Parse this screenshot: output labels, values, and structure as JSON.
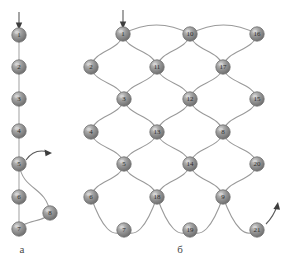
{
  "figure": {
    "panels": [
      {
        "id": "a",
        "caption": "а",
        "type": "linear-chain",
        "node_count": 8
      },
      {
        "id": "b",
        "caption": "б",
        "type": "lattice-network",
        "node_count": 21
      }
    ],
    "colors": {
      "node_fill": "#8c8c8c",
      "node_highlight": "#c9c9c9",
      "node_shadow": "#5f5f5f",
      "node_stroke": "#6e6e6e",
      "edge": "#9a9a9a",
      "arrow": "#3d3d3d",
      "label_text": "#2b2b2b",
      "background": "#ffffff"
    }
  },
  "panel_a": {
    "caption": "а",
    "entry_arrow": {
      "label": "input-arrow",
      "direction": "down"
    },
    "exit_arrow": {
      "label": "output-arrow",
      "direction": "right",
      "from_node": "5"
    },
    "nodes": [
      {
        "id": "1",
        "label": "1",
        "cx": 19,
        "cy": 35
      },
      {
        "id": "2",
        "label": "2",
        "cx": 19,
        "cy": 67
      },
      {
        "id": "3",
        "label": "3",
        "cx": 19,
        "cy": 99
      },
      {
        "id": "4",
        "label": "4",
        "cx": 19,
        "cy": 131
      },
      {
        "id": "5",
        "label": "5",
        "cx": 19,
        "cy": 164
      },
      {
        "id": "6",
        "label": "6",
        "cx": 19,
        "cy": 197
      },
      {
        "id": "7",
        "label": "7",
        "cx": 19,
        "cy": 229
      },
      {
        "id": "8",
        "label": "8",
        "cx": 50,
        "cy": 213
      }
    ],
    "edges": [
      {
        "from": "1",
        "to": "2",
        "shape": "straight"
      },
      {
        "from": "2",
        "to": "3",
        "shape": "straight"
      },
      {
        "from": "3",
        "to": "4",
        "shape": "straight"
      },
      {
        "from": "4",
        "to": "5",
        "shape": "straight"
      },
      {
        "from": "5",
        "to": "6",
        "shape": "straight"
      },
      {
        "from": "6",
        "to": "7",
        "shape": "straight"
      },
      {
        "from": "5",
        "to": "8",
        "shape": "curve"
      },
      {
        "from": "8",
        "to": "7",
        "shape": "curve"
      }
    ]
  },
  "panel_b": {
    "caption": "б",
    "entry_arrow": {
      "label": "input-arrow",
      "direction": "down",
      "to_node": "1"
    },
    "exit_arrow": {
      "label": "output-arrow",
      "direction": "up-right",
      "from_node": "21"
    },
    "nodes": [
      {
        "id": "1",
        "label": "1",
        "cx": 123,
        "cy": 34
      },
      {
        "id": "10",
        "label": "10",
        "cx": 190,
        "cy": 34
      },
      {
        "id": "16",
        "label": "16",
        "cx": 257,
        "cy": 34
      },
      {
        "id": "2",
        "label": "2",
        "cx": 91,
        "cy": 67
      },
      {
        "id": "11",
        "label": "11",
        "cx": 157,
        "cy": 67
      },
      {
        "id": "17",
        "label": "17",
        "cx": 223,
        "cy": 67
      },
      {
        "id": "3",
        "label": "3",
        "cx": 124,
        "cy": 99
      },
      {
        "id": "12",
        "label": "12",
        "cx": 190,
        "cy": 99
      },
      {
        "id": "15",
        "label": "15",
        "cx": 257,
        "cy": 99
      },
      {
        "id": "4",
        "label": "4",
        "cx": 91,
        "cy": 132
      },
      {
        "id": "13",
        "label": "13",
        "cx": 157,
        "cy": 132
      },
      {
        "id": "8",
        "label": "8",
        "cx": 223,
        "cy": 132
      },
      {
        "id": "5",
        "label": "5",
        "cx": 124,
        "cy": 164
      },
      {
        "id": "14",
        "label": "14",
        "cx": 190,
        "cy": 164
      },
      {
        "id": "20",
        "label": "20",
        "cx": 257,
        "cy": 164
      },
      {
        "id": "6",
        "label": "6",
        "cx": 91,
        "cy": 197
      },
      {
        "id": "18",
        "label": "18",
        "cx": 157,
        "cy": 197
      },
      {
        "id": "9",
        "label": "9",
        "cx": 223,
        "cy": 197
      },
      {
        "id": "7",
        "label": "7",
        "cx": 124,
        "cy": 230
      },
      {
        "id": "19",
        "label": "19",
        "cx": 190,
        "cy": 230
      },
      {
        "id": "21",
        "label": "21",
        "cx": 257,
        "cy": 230
      }
    ],
    "edges": [
      {
        "from": "1",
        "to": "10",
        "shape": "arc-top"
      },
      {
        "from": "10",
        "to": "16",
        "shape": "arc-top"
      },
      {
        "from": "1",
        "to": "2",
        "shape": "curve"
      },
      {
        "from": "1",
        "to": "11",
        "shape": "curve"
      },
      {
        "from": "10",
        "to": "11",
        "shape": "curve"
      },
      {
        "from": "10",
        "to": "17",
        "shape": "curve"
      },
      {
        "from": "16",
        "to": "17",
        "shape": "curve"
      },
      {
        "from": "2",
        "to": "3",
        "shape": "curve"
      },
      {
        "from": "11",
        "to": "3",
        "shape": "curve"
      },
      {
        "from": "11",
        "to": "12",
        "shape": "curve"
      },
      {
        "from": "17",
        "to": "12",
        "shape": "curve"
      },
      {
        "from": "17",
        "to": "15",
        "shape": "curve"
      },
      {
        "from": "3",
        "to": "4",
        "shape": "curve"
      },
      {
        "from": "3",
        "to": "13",
        "shape": "curve"
      },
      {
        "from": "12",
        "to": "13",
        "shape": "curve"
      },
      {
        "from": "12",
        "to": "8",
        "shape": "curve"
      },
      {
        "from": "15",
        "to": "8",
        "shape": "curve"
      },
      {
        "from": "4",
        "to": "5",
        "shape": "curve"
      },
      {
        "from": "13",
        "to": "5",
        "shape": "curve"
      },
      {
        "from": "13",
        "to": "14",
        "shape": "curve"
      },
      {
        "from": "8",
        "to": "14",
        "shape": "curve"
      },
      {
        "from": "8",
        "to": "20",
        "shape": "curve"
      },
      {
        "from": "5",
        "to": "6",
        "shape": "curve"
      },
      {
        "from": "5",
        "to": "18",
        "shape": "curve"
      },
      {
        "from": "14",
        "to": "18",
        "shape": "curve"
      },
      {
        "from": "14",
        "to": "9",
        "shape": "curve"
      },
      {
        "from": "20",
        "to": "9",
        "shape": "curve"
      },
      {
        "from": "6",
        "to": "7",
        "shape": "arc-bottom"
      },
      {
        "from": "18",
        "to": "7",
        "shape": "arc-bottom"
      },
      {
        "from": "18",
        "to": "19",
        "shape": "arc-bottom"
      },
      {
        "from": "9",
        "to": "19",
        "shape": "arc-bottom"
      },
      {
        "from": "9",
        "to": "21",
        "shape": "arc-bottom"
      }
    ]
  }
}
